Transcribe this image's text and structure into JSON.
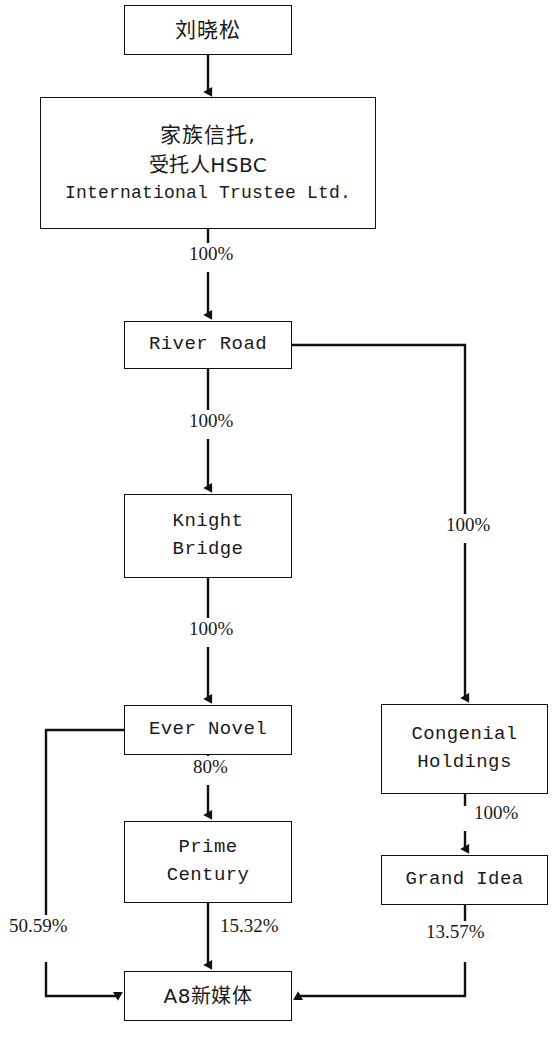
{
  "diagram": {
    "type": "ownership-structure-flowchart",
    "background_color": "#ffffff",
    "line_color": "#111111",
    "text_color": "#1a1a1a"
  },
  "nodes": [
    {
      "id": "liu-xiaosong",
      "name": "liu-xiaosong-node",
      "lines": [
        "刘晓松"
      ],
      "script": "cjk",
      "x": 124,
      "y": 5,
      "width": 168,
      "height": 50
    },
    {
      "id": "family-trust",
      "name": "family-trust-node",
      "lines": [
        "家族信托,",
        "受托人HSBC",
        "International Trustee Ltd."
      ],
      "script": "mixed",
      "x": 40,
      "y": 97,
      "width": 336,
      "height": 132
    },
    {
      "id": "river-road",
      "name": "river-road-node",
      "lines": [
        "River Road"
      ],
      "script": "latin",
      "x": 124,
      "y": 321,
      "width": 168,
      "height": 48
    },
    {
      "id": "knight-bridge",
      "name": "knight-bridge-node",
      "lines": [
        "Knight",
        "Bridge"
      ],
      "script": "latin",
      "x": 124,
      "y": 494,
      "width": 168,
      "height": 84
    },
    {
      "id": "ever-novel",
      "name": "ever-novel-node",
      "lines": [
        "Ever Novel"
      ],
      "script": "latin",
      "x": 124,
      "y": 705,
      "width": 168,
      "height": 50
    },
    {
      "id": "prime-century",
      "name": "prime-century-node",
      "lines": [
        "Prime",
        "Century"
      ],
      "script": "latin",
      "x": 124,
      "y": 821,
      "width": 168,
      "height": 82
    },
    {
      "id": "congenial-holdings",
      "name": "congenial-holdings-node",
      "lines": [
        "Congenial",
        "Holdings"
      ],
      "script": "latin",
      "x": 381,
      "y": 704,
      "width": 167,
      "height": 90
    },
    {
      "id": "grand-idea",
      "name": "grand-idea-node",
      "lines": [
        "Grand Idea"
      ],
      "script": "latin",
      "x": 381,
      "y": 855,
      "width": 167,
      "height": 50
    },
    {
      "id": "a8-new-media",
      "name": "a8-new-media-node",
      "lines": [
        "A8新媒体"
      ],
      "script": "mixed",
      "x": 124,
      "y": 971,
      "width": 168,
      "height": 50
    }
  ],
  "edges": [
    {
      "id": "e1",
      "from": "liu-xiaosong",
      "to": "family-trust",
      "label": "",
      "name": "edge-liu-to-trust"
    },
    {
      "id": "e2",
      "from": "family-trust",
      "to": "river-road",
      "label": "100%",
      "name": "edge-trust-to-river-road",
      "label_x": 186,
      "label_y": 253
    },
    {
      "id": "e3",
      "from": "river-road",
      "to": "knight-bridge",
      "label": "100%",
      "name": "edge-river-road-to-knight-bridge",
      "label_x": 186,
      "label_y": 420
    },
    {
      "id": "e4",
      "from": "river-road",
      "to": "congenial-holdings",
      "label": "100%",
      "name": "edge-river-road-to-congenial",
      "label_x": 443,
      "label_y": 524
    },
    {
      "id": "e5",
      "from": "knight-bridge",
      "to": "ever-novel",
      "label": "100%",
      "name": "edge-knight-bridge-to-ever-novel",
      "label_x": 186,
      "label_y": 628
    },
    {
      "id": "e6",
      "from": "ever-novel",
      "to": "prime-century",
      "label": "80%",
      "name": "edge-ever-novel-to-prime-century",
      "label_x": 192,
      "label_y": 766
    },
    {
      "id": "e7",
      "from": "congenial-holdings",
      "to": "grand-idea",
      "label": "100%",
      "name": "edge-congenial-to-grand-idea",
      "label_x": 471,
      "label_y": 812
    },
    {
      "id": "e8",
      "from": "prime-century",
      "to": "a8-new-media",
      "label": "15.32%",
      "name": "edge-prime-century-to-a8",
      "label_x": 218,
      "label_y": 925
    },
    {
      "id": "e9",
      "from": "ever-novel",
      "to": "a8-new-media",
      "label": "50.59%",
      "name": "edge-ever-novel-to-a8",
      "label_x": 8,
      "label_y": 925
    },
    {
      "id": "e10",
      "from": "grand-idea",
      "to": "a8-new-media",
      "label": "13.57%",
      "name": "edge-grand-idea-to-a8",
      "label_x": 424,
      "label_y": 931
    }
  ]
}
